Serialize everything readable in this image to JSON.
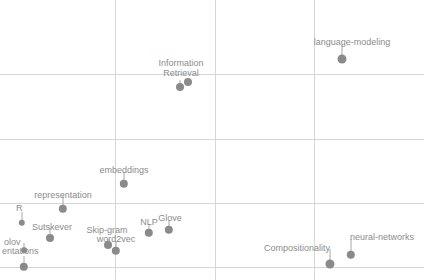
{
  "chart_data": {
    "type": "scatter",
    "title": "",
    "subtitle": "",
    "xlabel": "",
    "ylabel": "",
    "xlim": [
      0,
      424
    ],
    "ylim": [
      0,
      280
    ],
    "grid": true,
    "legend_position": "none",
    "axis_ticks_visible": false,
    "tick_labels_x": [],
    "tick_labels_y": [],
    "gridlines": {
      "vertical_x": [
        115,
        215,
        314
      ],
      "horizontal_y": [
        74,
        139,
        203,
        267
      ],
      "color": "#d6d6d8"
    },
    "colors": {
      "marker": "#8a8a8a",
      "label": "#8c8c8c",
      "leader": "#a8a8a8",
      "background": "#ffffff"
    },
    "points": [
      {
        "label": "Information",
        "label2": "Retrieval",
        "label_lines": [
          "Information",
          "Retrieval"
        ],
        "label_x": 181,
        "label_y": 58,
        "label_anchor": "middle",
        "marker_x": 180,
        "marker_y": 87,
        "marker_r": 4.0,
        "leader_x": 180,
        "leader_top": 80,
        "leader_bottom": 87,
        "clipped": false
      },
      {
        "label": "",
        "label_lines": [],
        "label_x": 0,
        "label_y": 0,
        "label_anchor": "middle",
        "marker_x": 188,
        "marker_y": 82,
        "marker_r": 4.0,
        "leader_x": 188,
        "leader_top": 80,
        "leader_bottom": 82,
        "clipped": false
      },
      {
        "label": "language-modeling",
        "label_lines": [
          "language-modeling"
        ],
        "label_x": 352,
        "label_y": 37,
        "label_anchor": "middle",
        "marker_x": 342,
        "marker_y": 59,
        "marker_r": 4.5,
        "leader_x": 342,
        "leader_top": 45,
        "leader_bottom": 59,
        "clipped": false
      },
      {
        "label": "embeddings",
        "label_lines": [
          "embeddings"
        ],
        "label_x": 124,
        "label_y": 165,
        "label_anchor": "middle",
        "marker_x": 124,
        "marker_y": 184,
        "marker_r": 4.2,
        "leader_x": 124,
        "leader_top": 172,
        "leader_bottom": 184,
        "clipped": false
      },
      {
        "label": "representation",
        "label_lines": [
          "representation"
        ],
        "label_x": 63,
        "label_y": 190,
        "label_anchor": "middle",
        "marker_x": 63,
        "marker_y": 209,
        "marker_r": 4.2,
        "leader_x": 63,
        "leader_top": 196,
        "leader_bottom": 209,
        "clipped": false
      },
      {
        "label": "R",
        "label_lines": [
          "R"
        ],
        "label_x": 16,
        "label_y": 203,
        "label_anchor": "start",
        "marker_x": 22,
        "marker_y": 223,
        "marker_r": 3.2,
        "leader_x": 22,
        "leader_top": 212,
        "leader_bottom": 223,
        "clipped": true
      },
      {
        "label": "Sutskever",
        "label_lines": [
          "Sutskever"
        ],
        "label_x": 52,
        "label_y": 222,
        "label_anchor": "middle",
        "marker_x": 50,
        "marker_y": 238,
        "marker_r": 4.0,
        "leader_x": 50,
        "leader_top": 228,
        "leader_bottom": 238,
        "clipped": false
      },
      {
        "label": "olov",
        "label_lines": [
          "olov"
        ],
        "label_x": 4,
        "label_y": 237,
        "label_anchor": "start",
        "marker_x": 24,
        "marker_y": 250,
        "marker_r": 2.8,
        "leader_x": 24,
        "leader_top": 243,
        "leader_bottom": 250,
        "clipped": true
      },
      {
        "label": "entations",
        "label_lines": [
          "entations"
        ],
        "label_x": 2,
        "label_y": 246,
        "label_anchor": "start",
        "marker_x": 24,
        "marker_y": 267,
        "marker_r": 4.2,
        "leader_x": 24,
        "leader_top": 256,
        "leader_bottom": 267,
        "clipped": true
      },
      {
        "label": "Skip-gram",
        "label_lines": [
          "Skip-gram"
        ],
        "label_x": 107,
        "label_y": 225,
        "label_anchor": "middle",
        "marker_x": 108,
        "marker_y": 245,
        "marker_r": 4.0,
        "leader_x": 108,
        "leader_top": 239,
        "leader_bottom": 245,
        "clipped": false
      },
      {
        "label": "word2vec",
        "label_lines": [
          "word2vec"
        ],
        "label_x": 116,
        "label_y": 234,
        "label_anchor": "middle",
        "marker_x": 116,
        "marker_y": 251,
        "marker_r": 4.2,
        "leader_x": 116,
        "leader_top": 241,
        "leader_bottom": 251,
        "clipped": false
      },
      {
        "label": "NLP",
        "label_lines": [
          "NLP"
        ],
        "label_x": 149,
        "label_y": 217,
        "label_anchor": "middle",
        "marker_x": 149,
        "marker_y": 233,
        "marker_r": 4.2,
        "leader_x": 149,
        "leader_top": 224,
        "leader_bottom": 233,
        "clipped": false
      },
      {
        "label": "Glove",
        "label_lines": [
          "Glove"
        ],
        "label_x": 170,
        "label_y": 213,
        "label_anchor": "middle",
        "marker_x": 169,
        "marker_y": 230,
        "marker_r": 4.2,
        "leader_x": 169,
        "leader_top": 220,
        "leader_bottom": 230,
        "clipped": false
      },
      {
        "label": "Compositionality",
        "label_lines": [
          "Compositionality"
        ],
        "label_x": 330,
        "label_y": 243,
        "label_anchor": "end",
        "marker_x": 330,
        "marker_y": 264,
        "marker_r": 4.5,
        "leader_x": 330,
        "leader_top": 249,
        "leader_bottom": 264,
        "clipped": false
      },
      {
        "label": "neural-networks",
        "label_lines": [
          "neural-networks"
        ],
        "label_x": 350,
        "label_y": 232,
        "label_anchor": "start",
        "marker_x": 351,
        "marker_y": 255,
        "marker_r": 4.2,
        "leader_x": 351,
        "leader_top": 239,
        "leader_bottom": 255,
        "clipped": false
      }
    ]
  }
}
